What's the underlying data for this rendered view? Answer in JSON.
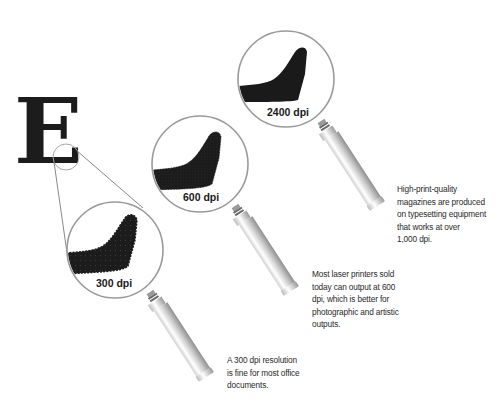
{
  "figure": {
    "letter": "E",
    "colors": {
      "background": "#ffffff",
      "ink": "#1c1c1c",
      "lens_rim": "#9a9a9a",
      "connector": "#555555",
      "handle_light": "#f4f4f4",
      "handle_dark": "#a8a8a8",
      "text": "#2a2a2a"
    },
    "lenses": [
      {
        "id": "300",
        "label": "300 dpi",
        "caption_lines": [
          "A 300 dpi resolution",
          "is fine for most office",
          "documents."
        ]
      },
      {
        "id": "600",
        "label": "600 dpi",
        "caption_lines": [
          "Most laser printers sold",
          "today can output at 600",
          "dpi, which is better for",
          "photographic and artistic",
          "outputs."
        ]
      },
      {
        "id": "2400",
        "label": "2400 dpi",
        "caption_lines": [
          "High-print-quality",
          "magazines are produced",
          "on typesetting equipment",
          "that works at over",
          "1,000 dpi."
        ]
      }
    ]
  }
}
